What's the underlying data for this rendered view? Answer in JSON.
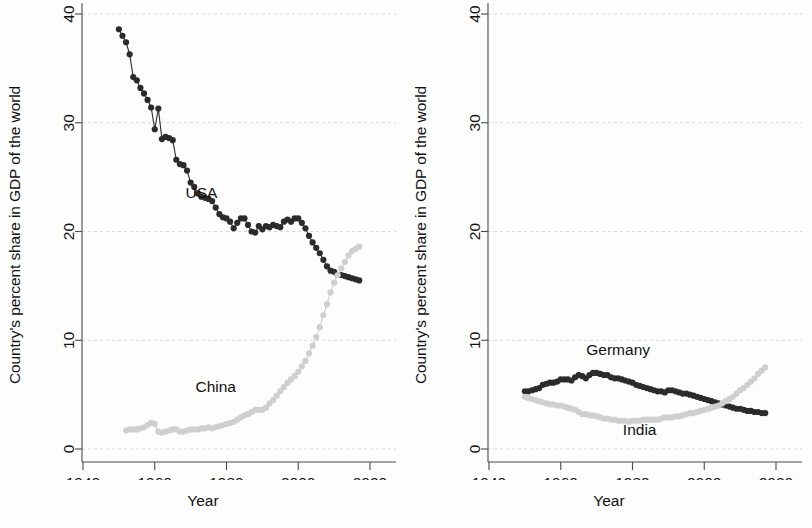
{
  "figure": {
    "panels": [
      {
        "id": "usa-china",
        "xlabel": "Year",
        "ylabel": "Country's percent share in GDP of the world"
      },
      {
        "id": "germany-india",
        "xlabel": "Year",
        "ylabel": "Country's percent share in GDP of the world"
      }
    ],
    "axis": {
      "yticks": [
        "0",
        "10",
        "20",
        "30",
        "40"
      ],
      "xticks": [
        "1940",
        "1960",
        "1980",
        "2000",
        "2020"
      ]
    },
    "colors": {
      "dark_series": "#2b2b2b",
      "light_series": "#cfcfcf",
      "gridline": "#cfcfcf",
      "axis": "#4a4a4a",
      "text": "#111111",
      "background": "#fdfdfd"
    }
  },
  "chart_data": [
    {
      "type": "line",
      "id": "usa-china",
      "title": "",
      "xlabel": "Year",
      "ylabel": "Country's percent share in GDP of the world",
      "xlim": [
        1936,
        2024
      ],
      "ylim": [
        0,
        41
      ],
      "xticks": [
        1940,
        1960,
        1980,
        2000,
        2020
      ],
      "yticks": [
        0,
        10,
        20,
        30,
        40
      ],
      "grid": true,
      "legend": "inline-annotation",
      "markers": true,
      "series": [
        {
          "name": "USA",
          "color": "#2b2b2b",
          "label_x": 1973,
          "label_y": 23.1,
          "x": [
            1950,
            1951,
            1952,
            1953,
            1954,
            1955,
            1956,
            1957,
            1958,
            1959,
            1960,
            1961,
            1962,
            1963,
            1964,
            1965,
            1966,
            1967,
            1968,
            1969,
            1970,
            1971,
            1972,
            1973,
            1974,
            1975,
            1976,
            1977,
            1978,
            1979,
            1980,
            1981,
            1982,
            1983,
            1984,
            1985,
            1986,
            1987,
            1988,
            1989,
            1990,
            1991,
            1992,
            1993,
            1994,
            1995,
            1996,
            1997,
            1998,
            1999,
            2000,
            2001,
            2002,
            2003,
            2004,
            2005,
            2006,
            2007,
            2008,
            2009,
            2010,
            2011,
            2012,
            2013,
            2014,
            2015,
            2016,
            2017
          ],
          "y": [
            38.6,
            38.0,
            37.4,
            36.3,
            34.2,
            33.9,
            33.2,
            32.7,
            32.1,
            31.4,
            29.4,
            31.3,
            28.5,
            28.7,
            28.6,
            28.4,
            26.6,
            26.2,
            26.1,
            25.6,
            24.5,
            24.1,
            23.5,
            23.2,
            23.1,
            23.0,
            22.8,
            22.2,
            21.6,
            21.3,
            21.2,
            20.9,
            20.3,
            20.8,
            21.2,
            21.2,
            20.6,
            20.0,
            19.9,
            20.5,
            20.2,
            20.5,
            20.4,
            20.6,
            20.5,
            20.4,
            20.9,
            21.1,
            20.9,
            21.2,
            21.2,
            20.8,
            20.3,
            19.6,
            19.0,
            18.5,
            18.0,
            17.4,
            16.8,
            16.4,
            16.3,
            16.0,
            16.0,
            15.9,
            15.8,
            15.7,
            15.6,
            15.5
          ]
        },
        {
          "name": "China",
          "color": "#cfcfcf",
          "label_x": 1977,
          "label_y": 5.2,
          "x": [
            1952,
            1953,
            1954,
            1955,
            1956,
            1957,
            1958,
            1959,
            1960,
            1961,
            1962,
            1963,
            1964,
            1965,
            1966,
            1967,
            1968,
            1969,
            1970,
            1971,
            1972,
            1973,
            1974,
            1975,
            1976,
            1977,
            1978,
            1979,
            1980,
            1981,
            1982,
            1983,
            1984,
            1985,
            1986,
            1987,
            1988,
            1989,
            1990,
            1991,
            1992,
            1993,
            1994,
            1995,
            1996,
            1997,
            1998,
            1999,
            2000,
            2001,
            2002,
            2003,
            2004,
            2005,
            2006,
            2007,
            2008,
            2009,
            2010,
            2011,
            2012,
            2013,
            2014,
            2015,
            2016,
            2017
          ],
          "y": [
            1.7,
            1.8,
            1.8,
            1.8,
            1.9,
            2.0,
            2.2,
            2.4,
            2.3,
            1.6,
            1.5,
            1.6,
            1.7,
            1.8,
            1.8,
            1.6,
            1.6,
            1.7,
            1.8,
            1.8,
            1.8,
            1.9,
            1.9,
            2.0,
            1.9,
            2.0,
            2.1,
            2.2,
            2.3,
            2.4,
            2.5,
            2.7,
            2.9,
            3.1,
            3.2,
            3.4,
            3.6,
            3.6,
            3.6,
            3.8,
            4.2,
            4.5,
            4.9,
            5.3,
            5.7,
            6.1,
            6.4,
            6.7,
            7.1,
            7.6,
            8.1,
            8.8,
            9.5,
            10.3,
            11.2,
            12.3,
            13.3,
            14.4,
            15.3,
            16.0,
            16.6,
            17.2,
            17.8,
            18.2,
            18.4,
            18.6
          ]
        }
      ]
    },
    {
      "type": "line",
      "id": "germany-india",
      "title": "",
      "xlabel": "Year",
      "ylabel": "Country's percent share in GDP of the world",
      "xlim": [
        1936,
        2024
      ],
      "ylim": [
        0,
        41
      ],
      "xticks": [
        1940,
        1960,
        1980,
        2000,
        2020
      ],
      "yticks": [
        0,
        10,
        20,
        30,
        40
      ],
      "grid": true,
      "legend": "inline-annotation",
      "markers": true,
      "series": [
        {
          "name": "Germany",
          "color": "#2b2b2b",
          "label_x": 1976,
          "label_y": 8.6,
          "x": [
            1950,
            1951,
            1952,
            1953,
            1954,
            1955,
            1956,
            1957,
            1958,
            1959,
            1960,
            1961,
            1962,
            1963,
            1964,
            1965,
            1966,
            1967,
            1968,
            1969,
            1970,
            1971,
            1972,
            1973,
            1974,
            1975,
            1976,
            1977,
            1978,
            1979,
            1980,
            1981,
            1982,
            1983,
            1984,
            1985,
            1986,
            1987,
            1988,
            1989,
            1990,
            1991,
            1992,
            1993,
            1994,
            1995,
            1996,
            1997,
            1998,
            1999,
            2000,
            2001,
            2002,
            2003,
            2004,
            2005,
            2006,
            2007,
            2008,
            2009,
            2010,
            2011,
            2012,
            2013,
            2014,
            2015,
            2016,
            2017
          ],
          "y": [
            5.3,
            5.3,
            5.4,
            5.5,
            5.6,
            5.9,
            6.0,
            6.1,
            6.1,
            6.2,
            6.4,
            6.4,
            6.4,
            6.3,
            6.6,
            6.8,
            6.7,
            6.5,
            6.8,
            7.0,
            7.0,
            6.9,
            6.8,
            6.8,
            6.6,
            6.5,
            6.5,
            6.4,
            6.3,
            6.2,
            6.1,
            5.9,
            5.8,
            5.7,
            5.6,
            5.5,
            5.4,
            5.3,
            5.3,
            5.2,
            5.4,
            5.4,
            5.3,
            5.2,
            5.1,
            5.1,
            5.0,
            4.9,
            4.8,
            4.7,
            4.6,
            4.5,
            4.4,
            4.3,
            4.2,
            4.1,
            4.0,
            3.9,
            3.8,
            3.7,
            3.7,
            3.6,
            3.5,
            3.5,
            3.4,
            3.4,
            3.3,
            3.3
          ]
        },
        {
          "name": "India",
          "color": "#cfcfcf",
          "label_x": 1982,
          "label_y": 1.3,
          "x": [
            1950,
            1951,
            1952,
            1953,
            1954,
            1955,
            1956,
            1957,
            1958,
            1959,
            1960,
            1961,
            1962,
            1963,
            1964,
            1965,
            1966,
            1967,
            1968,
            1969,
            1970,
            1971,
            1972,
            1973,
            1974,
            1975,
            1976,
            1977,
            1978,
            1979,
            1980,
            1981,
            1982,
            1983,
            1984,
            1985,
            1986,
            1987,
            1988,
            1989,
            1990,
            1991,
            1992,
            1993,
            1994,
            1995,
            1996,
            1997,
            1998,
            1999,
            2000,
            2001,
            2002,
            2003,
            2004,
            2005,
            2006,
            2007,
            2008,
            2009,
            2010,
            2011,
            2012,
            2013,
            2014,
            2015,
            2016,
            2017
          ],
          "y": [
            4.8,
            4.7,
            4.6,
            4.5,
            4.4,
            4.3,
            4.2,
            4.1,
            4.1,
            4.0,
            4.0,
            3.9,
            3.8,
            3.7,
            3.6,
            3.4,
            3.2,
            3.2,
            3.1,
            3.1,
            3.0,
            2.9,
            2.8,
            2.8,
            2.7,
            2.7,
            2.6,
            2.6,
            2.6,
            2.5,
            2.6,
            2.6,
            2.6,
            2.7,
            2.7,
            2.7,
            2.7,
            2.7,
            2.8,
            2.9,
            2.9,
            2.9,
            3.0,
            3.0,
            3.1,
            3.2,
            3.3,
            3.3,
            3.4,
            3.5,
            3.6,
            3.7,
            3.8,
            3.9,
            4.0,
            4.2,
            4.4,
            4.6,
            4.8,
            5.1,
            5.4,
            5.6,
            5.9,
            6.2,
            6.5,
            6.9,
            7.2,
            7.5
          ]
        }
      ]
    }
  ]
}
